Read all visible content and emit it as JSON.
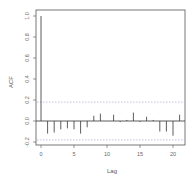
{
  "chart_data": {
    "type": "bar",
    "title": "",
    "xlabel": "Lag",
    "ylabel": "ACF",
    "x": [
      0,
      1,
      2,
      3,
      4,
      5,
      6,
      7,
      8,
      9,
      10,
      11,
      12,
      13,
      14,
      15,
      16,
      17,
      18,
      19,
      20,
      21
    ],
    "values": [
      1.0,
      -0.12,
      -0.11,
      -0.08,
      -0.07,
      -0.08,
      -0.12,
      -0.06,
      0.05,
      0.07,
      0.0,
      0.06,
      -0.01,
      0.01,
      0.08,
      -0.01,
      0.04,
      0.01,
      -0.1,
      -0.1,
      -0.14,
      0.06
    ],
    "xlim": [
      -1,
      22
    ],
    "ylim": [
      -0.25,
      1.02
    ],
    "xticks": [
      0,
      5,
      10,
      15,
      20
    ],
    "yticks": [
      -0.2,
      0.0,
      0.2,
      0.4,
      0.6,
      0.8,
      1.0
    ],
    "ytick_labels": [
      "-0.2",
      "0.0",
      "0.2",
      "0.4",
      "0.6",
      "0.8",
      "1.0"
    ],
    "confidence_band": 0.18,
    "grid": false,
    "legend": "none"
  },
  "colors": {
    "bar": "#333333",
    "frame": "#555555",
    "band": "#9999cc",
    "zero_line": "#333333"
  }
}
